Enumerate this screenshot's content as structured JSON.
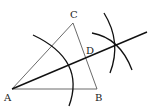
{
  "diagram": {
    "labels": {
      "A": "A",
      "B": "B",
      "C": "C",
      "D": "D"
    },
    "points": {
      "A": [
        12,
        89
      ],
      "B": [
        97,
        89
      ],
      "C": [
        73,
        23
      ],
      "D": [
        86,
        57
      ],
      "arc_intersection": [
        114,
        45
      ]
    },
    "segments": [
      {
        "from": "A",
        "to": "B",
        "style": "thin"
      },
      {
        "from": "A",
        "to": "C",
        "style": "thin"
      },
      {
        "from": "C",
        "to": "B",
        "style": "thin"
      },
      {
        "from": "A",
        "to": "ray_end",
        "style": "thick",
        "description": "bisector of angle A through D"
      }
    ],
    "arcs": [
      {
        "center": "A",
        "description": "arc centered at A crossing AB and AC"
      },
      {
        "description": "arc from AC intersection"
      },
      {
        "description": "arc from AB intersection"
      }
    ],
    "colors": {
      "line": "#111111",
      "background": "#ffffff"
    }
  }
}
